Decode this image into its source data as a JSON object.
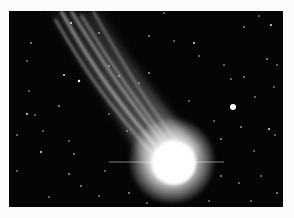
{
  "image": {
    "subject": "Comet with bright coma and long ion tail against a starfield",
    "alt": "Comet photograph",
    "colors": {
      "background_border": "#fbfbfb",
      "sky": "#050505",
      "coma": "#ffffff",
      "tail": "#d8d8d8"
    }
  }
}
